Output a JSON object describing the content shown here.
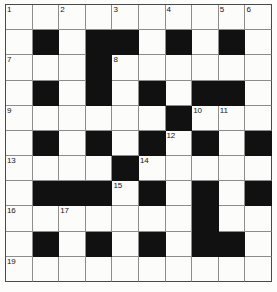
{
  "puzzle": {
    "type": "crossword-grid",
    "title": "Crossword Puzzle Grid",
    "columns": 10,
    "rows": 11,
    "colors": {
      "block": "#111111",
      "cell": "#fcfcfa",
      "grid_line": "#8d8d8d",
      "border": "#4a4a4a",
      "number_text": "#141414"
    },
    "legend": {
      "white_cell": "empty-answer-cell",
      "black_cell": "blocked-cell"
    },
    "clue_numbers": [
      1,
      2,
      3,
      4,
      5,
      6,
      7,
      8,
      9,
      10,
      11,
      12,
      13,
      14,
      15,
      16,
      17,
      18,
      19
    ],
    "grid": [
      [
        "0",
        "0",
        "0",
        "0",
        "0",
        "0",
        "0",
        "0",
        "0",
        "0"
      ],
      [
        "0",
        "1",
        "0",
        "1",
        "1",
        "0",
        "1",
        "0",
        "1",
        "0"
      ],
      [
        "0",
        "0",
        "0",
        "1",
        "0",
        "0",
        "0",
        "0",
        "0",
        "0"
      ],
      [
        "0",
        "1",
        "0",
        "1",
        "0",
        "1",
        "0",
        "1",
        "1",
        "0"
      ],
      [
        "0",
        "0",
        "0",
        "0",
        "0",
        "0",
        "1",
        "0",
        "0",
        "0"
      ],
      [
        "0",
        "1",
        "0",
        "1",
        "0",
        "1",
        "0",
        "1",
        "0",
        "1"
      ],
      [
        "0",
        "0",
        "0",
        "0",
        "1",
        "0",
        "0",
        "0",
        "0",
        "0"
      ],
      [
        "0",
        "1",
        "1",
        "1",
        "0",
        "1",
        "0",
        "1",
        "0",
        "1"
      ],
      [
        "0",
        "0",
        "0",
        "0",
        "0",
        "0",
        "0",
        "1",
        "0",
        "0"
      ],
      [
        "0",
        "1",
        "0",
        "1",
        "0",
        "1",
        "0",
        "1",
        "1",
        "0"
      ],
      [
        "0",
        "0",
        "0",
        "0",
        "0",
        "0",
        "0",
        "0",
        "0",
        "0"
      ]
    ],
    "numbers": [
      {
        "row": 0,
        "col": 0,
        "n": "1"
      },
      {
        "row": 0,
        "col": 2,
        "n": "2"
      },
      {
        "row": 0,
        "col": 4,
        "n": "3"
      },
      {
        "row": 0,
        "col": 6,
        "n": "4"
      },
      {
        "row": 0,
        "col": 8,
        "n": "5"
      },
      {
        "row": 0,
        "col": 9,
        "n": "6"
      },
      {
        "row": 2,
        "col": 0,
        "n": "7"
      },
      {
        "row": 2,
        "col": 4,
        "n": "8"
      },
      {
        "row": 4,
        "col": 0,
        "n": "9"
      },
      {
        "row": 4,
        "col": 7,
        "n": "10"
      },
      {
        "row": 4,
        "col": 8,
        "n": "11"
      },
      {
        "row": 5,
        "col": 6,
        "n": "12"
      },
      {
        "row": 6,
        "col": 0,
        "n": "13"
      },
      {
        "row": 6,
        "col": 5,
        "n": "14"
      },
      {
        "row": 7,
        "col": 4,
        "n": "15"
      },
      {
        "row": 8,
        "col": 0,
        "n": "16"
      },
      {
        "row": 8,
        "col": 2,
        "n": "17"
      },
      {
        "row": 8,
        "col": 7,
        "n": "18"
      },
      {
        "row": 10,
        "col": 0,
        "n": "19"
      }
    ],
    "letters": []
  }
}
